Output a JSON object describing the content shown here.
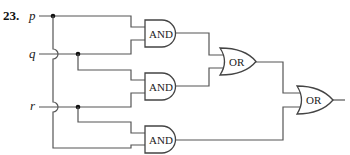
{
  "problem": {
    "number": "23.",
    "inputs": [
      {
        "id": "p",
        "label": "p"
      },
      {
        "id": "q",
        "label": "q"
      },
      {
        "id": "r",
        "label": "r"
      }
    ],
    "gates": [
      {
        "id": "and1",
        "type": "AND",
        "label": "AND",
        "inputs": [
          "p",
          "q"
        ]
      },
      {
        "id": "and2",
        "type": "AND",
        "label": "AND",
        "inputs": [
          "q",
          "r"
        ]
      },
      {
        "id": "and3",
        "type": "AND",
        "label": "AND",
        "inputs": [
          "r",
          "p"
        ]
      },
      {
        "id": "or1",
        "type": "OR",
        "label": "OR",
        "inputs": [
          "and1",
          "and2"
        ]
      },
      {
        "id": "or2",
        "type": "OR",
        "label": "OR",
        "inputs": [
          "or1",
          "and3"
        ]
      }
    ]
  }
}
